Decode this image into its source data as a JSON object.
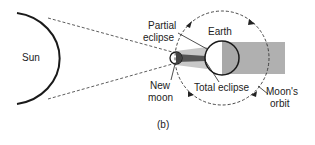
{
  "labels": {
    "sun": "Sun",
    "partial_1": "Partial",
    "partial_2": "eclipse",
    "earth": "Earth",
    "new_1": "New",
    "new_2": "moon",
    "total": "Total eclipse",
    "orbit_1": "Moon's",
    "orbit_2": "orbit",
    "panel": "(b)"
  },
  "colors": {
    "line": "#1a1a1a",
    "earth_night": "#a8a8a8",
    "shadow_band": "#b0b0b0",
    "umbra": "#555555",
    "penumbra": "#c4c4c4"
  }
}
